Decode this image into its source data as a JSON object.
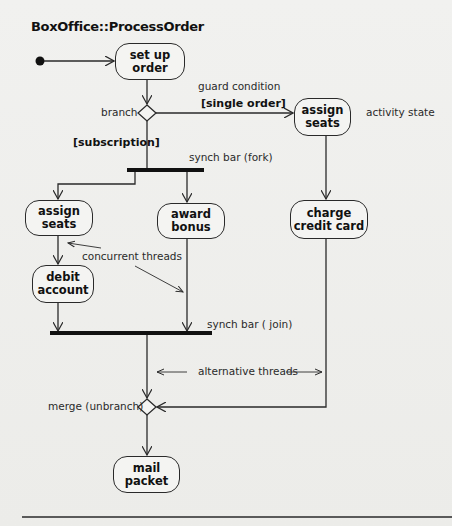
{
  "diagram": {
    "title": "BoxOffice::ProcessOrder",
    "nodes": {
      "set_up_order": "set up order",
      "assign_seats_single": "assign seats",
      "assign_seats_sub": "assign seats",
      "award_bonus": "award bonus",
      "charge_credit_card": "charge credit card",
      "debit_account": "debit account",
      "mail_packet": "mail packet"
    },
    "node_lines": {
      "set_up_order": [
        "set up",
        "order"
      ],
      "assign_seats_single": [
        "assign",
        "seats"
      ],
      "assign_seats_sub": [
        "assign",
        "seats"
      ],
      "award_bonus": [
        "award",
        "bonus"
      ],
      "charge_credit_card": [
        "charge",
        "credit card"
      ],
      "debit_account": [
        "debit",
        "account"
      ],
      "mail_packet": [
        "mail",
        "packet"
      ]
    },
    "labels": {
      "branch": "branch",
      "guard_condition": "guard condition",
      "single_order_guard": "[single order]",
      "activity_state": "activity state",
      "subscription_guard": "[subscription]",
      "synch_bar_fork": "synch bar (fork)",
      "concurrent_threads": "concurrent threads",
      "synch_bar_join": "synch bar ( join)",
      "alternative_threads": "alternative threads",
      "merge": "merge (unbranch)"
    },
    "colors": {
      "line": "#2a2a2a",
      "node_fill": "#f4f4f2",
      "background": "#efefed"
    }
  }
}
